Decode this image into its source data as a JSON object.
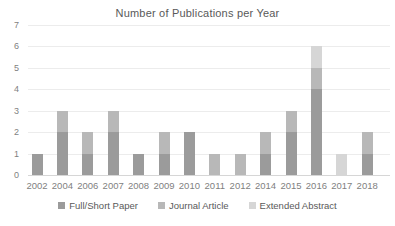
{
  "chart_data": {
    "type": "bar",
    "stacked": true,
    "title": "Number of Publications per Year",
    "xlabel": "",
    "ylabel": "",
    "categories": [
      "2002",
      "2004",
      "2006",
      "2007",
      "2008",
      "2009",
      "2010",
      "2011",
      "2012",
      "2014",
      "2015",
      "2016",
      "2017",
      "2018"
    ],
    "series": [
      {
        "name": "Full/Short Paper",
        "color": "#9b9b9b",
        "values": [
          1,
          2,
          1,
          2,
          1,
          1,
          2,
          0,
          0,
          1,
          2,
          4,
          0,
          1
        ]
      },
      {
        "name": "Journal Article",
        "color": "#b8b8b8",
        "values": [
          0,
          1,
          1,
          1,
          0,
          1,
          0,
          1,
          1,
          1,
          1,
          1,
          0,
          1
        ]
      },
      {
        "name": "Extended Abstract",
        "color": "#d6d6d6",
        "values": [
          0,
          0,
          0,
          0,
          0,
          0,
          0,
          0,
          0,
          0,
          0,
          1,
          1,
          0
        ]
      }
    ],
    "totals_by_year": [
      1,
      3,
      2,
      3,
      1,
      2,
      2,
      1,
      1,
      2,
      3,
      6,
      1,
      2
    ],
    "ylim": [
      0,
      7
    ],
    "yticks": [
      0,
      1,
      2,
      3,
      4,
      5,
      6,
      7
    ],
    "grid": true,
    "legend_position": "bottom",
    "colors": {
      "title_text": "#595959",
      "axis_text": "#7f7f7f",
      "gridline": "#ececec",
      "axis_line": "#d6d6d6",
      "background": "#ffffff"
    }
  }
}
